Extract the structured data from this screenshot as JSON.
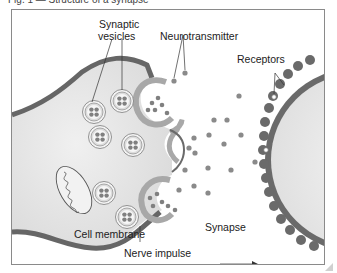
{
  "caption": {
    "text": "Fig. 1 — Structure of a synapse"
  },
  "diagram": {
    "labels": {
      "synaptic_vesicles_line1": "Synaptic",
      "synaptic_vesicles_line2": "vesicles",
      "neurotransmitter": "Neurotransmitter",
      "receptors": "Receptors",
      "cell_membrane": "Cell membrane",
      "synapse": "Synapse",
      "nerve_impulse": "Nerve impulse"
    },
    "arrow": {
      "direction": "right",
      "glyph": "→"
    },
    "colors": {
      "membrane": "#6b6b6b",
      "cytoplasm": "#e4e4e4",
      "vesicle_ring": "#b8b8b8",
      "neurotransmitter_dot": "#8a8a8a",
      "receiving_cell": "#eeeeee",
      "frame_border": "#8a8a8a"
    }
  }
}
